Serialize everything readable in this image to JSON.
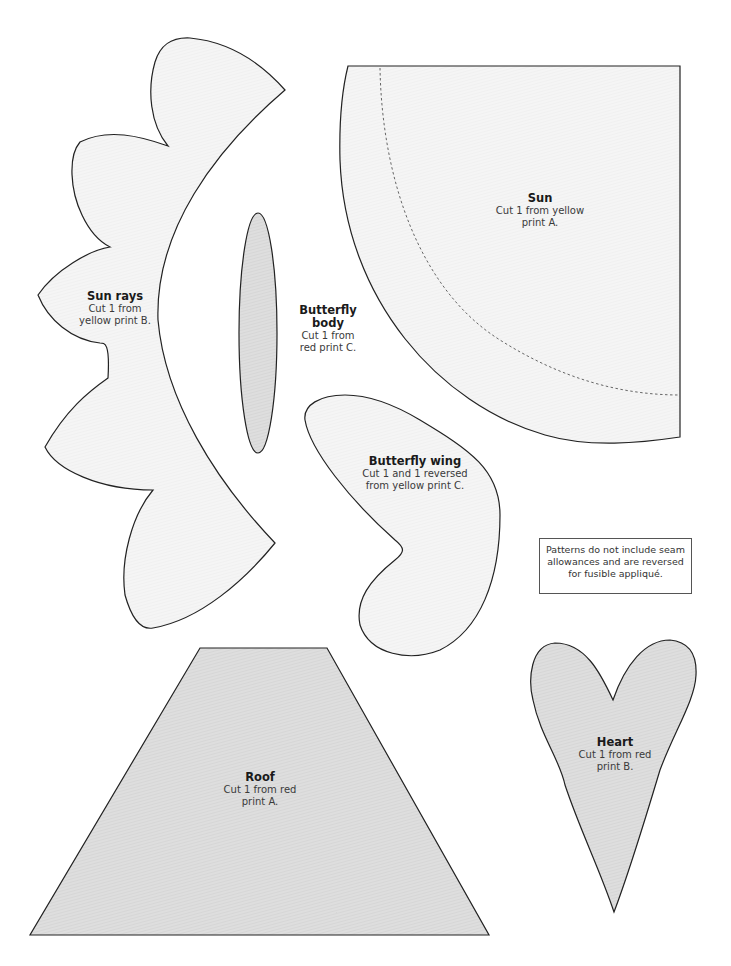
{
  "page": {
    "type": "applique pattern sheet",
    "colors": {
      "light_fill": "#f4f4f4",
      "dark_fill": "#dcdcdc",
      "outline": "#222222"
    }
  },
  "pieces": {
    "sun_rays": {
      "title": "Sun rays",
      "lines": [
        "Cut 1 from",
        "yellow print B."
      ]
    },
    "butterfly_body": {
      "title_lines": [
        "Butterfly",
        "body"
      ],
      "lines": [
        "Cut 1 from",
        "red print C."
      ]
    },
    "sun": {
      "title": "Sun",
      "lines": [
        "Cut 1 from yellow",
        "print A."
      ]
    },
    "butterfly_wing": {
      "title": "Butterfly wing",
      "lines": [
        "Cut 1 and 1 reversed",
        "from yellow print C."
      ]
    },
    "roof": {
      "title": "Roof",
      "lines": [
        "Cut 1 from red",
        "print A."
      ]
    },
    "heart": {
      "title": "Heart",
      "lines": [
        "Cut 1 from red",
        "print B."
      ]
    }
  },
  "note": {
    "lines": [
      "Patterns do not include seam",
      "allowances and are reversed",
      "for fusible appliqué."
    ]
  }
}
